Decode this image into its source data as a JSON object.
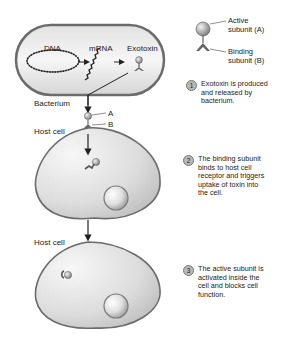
{
  "diagram": {
    "title": "",
    "bacterium": {
      "label": "Bacterium",
      "inner_labels": {
        "dna": "DNA",
        "mrna": "mRNA",
        "exotoxin": "Exotoxin"
      }
    },
    "legend": {
      "active": "Active\nsubunit (A)",
      "binding": "Binding\nsubunit (B)"
    },
    "markers": {
      "a": "A",
      "b": "B"
    },
    "host_cell_1": {
      "label": "Host cell"
    },
    "host_cell_2": {
      "label": "Host cell"
    },
    "steps": [
      {
        "number": "1",
        "text": "Exotoxin is produced\nand released by\nbacterium."
      },
      {
        "number": "2",
        "text": "The binding subunit\nbinds to host cell\nreceptor and triggers\nuptake of toxin into\nthe cell."
      },
      {
        "number": "3",
        "text": "The active subunit is\nactivated inside the\ncell and blocks cell\nfunction."
      }
    ],
    "colors": {
      "membrane": "#6b6b6b",
      "cell_fill_light": "#f4f4f4",
      "cell_fill_dark": "#bdbdbd",
      "text": "#222222"
    }
  }
}
